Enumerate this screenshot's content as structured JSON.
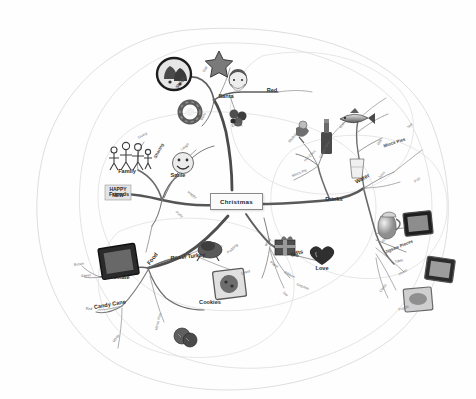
{
  "document": {
    "type": "mind-map",
    "title": "Christmas",
    "background_color": "#ffffff",
    "ink_color": "#3a3a3a",
    "style": "hand-drawn greyscale mind map with clip-art images and organic enclosing boundary outlines"
  },
  "central_node": {
    "label": "Christmas",
    "x": 238,
    "y": 202
  },
  "branches": [
    {
      "name": "people",
      "direction": "left",
      "color": "#555555",
      "nodes": [
        {
          "label": "Family",
          "level": 1,
          "x": 127,
          "y": 171,
          "rotate": 0
        },
        {
          "label": "Friends",
          "level": 1,
          "x": 119,
          "y": 194,
          "rotate": 0
        },
        {
          "label": "Smile",
          "level": 1,
          "x": 178,
          "y": 175,
          "rotate": 0
        },
        {
          "label": "Sharing",
          "level": 2,
          "x": 163,
          "y": 158,
          "rotate": -62
        },
        {
          "label": "Giving",
          "level": 3,
          "x": 143,
          "y": 138,
          "rotate": -28
        },
        {
          "label": "Laugh",
          "level": 3,
          "x": 186,
          "y": 150,
          "rotate": -40
        },
        {
          "label": "Happy",
          "level": 3,
          "x": 193,
          "y": 192,
          "rotate": 34
        },
        {
          "label": "Party",
          "level": 3,
          "x": 180,
          "y": 212,
          "rotate": 36
        }
      ]
    },
    {
      "name": "santa",
      "direction": "top",
      "color": "#4b4b4b",
      "nodes": [
        {
          "label": "Santa",
          "level": 1,
          "x": 226,
          "y": 96,
          "rotate": 0
        },
        {
          "label": "Red",
          "level": 1,
          "x": 272,
          "y": 90,
          "rotate": 0
        },
        {
          "label": "Sleigh",
          "level": 2,
          "x": 183,
          "y": 88,
          "rotate": -56
        },
        {
          "label": "Star",
          "level": 3,
          "x": 207,
          "y": 72,
          "rotate": -62
        },
        {
          "label": "Bells",
          "level": 3,
          "x": 205,
          "y": 120,
          "rotate": -60
        },
        {
          "label": "Elves",
          "level": 3,
          "x": 236,
          "y": 126,
          "rotate": -20
        }
      ]
    },
    {
      "name": "drinks",
      "direction": "upper-right",
      "color": "#5a5a5a",
      "nodes": [
        {
          "label": "Drinks",
          "level": 1,
          "x": 334,
          "y": 199,
          "rotate": 0
        },
        {
          "label": "Water",
          "level": 1,
          "x": 363,
          "y": 182,
          "rotate": -28
        },
        {
          "label": "Mince Pies",
          "level": 2,
          "x": 395,
          "y": 146,
          "rotate": -18
        },
        {
          "label": "Fish",
          "level": 3,
          "x": 344,
          "y": 128,
          "rotate": -58
        },
        {
          "label": "Mulled Wine",
          "level": 3,
          "x": 299,
          "y": 142,
          "rotate": -48
        },
        {
          "label": "Hot Choc",
          "level": 3,
          "x": 312,
          "y": 161,
          "rotate": -44
        },
        {
          "label": "Mince Pie",
          "level": 3,
          "x": 300,
          "y": 176,
          "rotate": -22
        },
        {
          "label": "Ginger Beer",
          "level": 3,
          "x": 330,
          "y": 158,
          "rotate": -62
        },
        {
          "label": "Milk",
          "level": 3,
          "x": 381,
          "y": 145,
          "rotate": -56
        },
        {
          "label": "Tea",
          "level": 3,
          "x": 411,
          "y": 128,
          "rotate": -50
        },
        {
          "label": "Juice",
          "level": 3,
          "x": 383,
          "y": 178,
          "rotate": -46
        },
        {
          "label": "Fizz",
          "level": 3,
          "x": 418,
          "y": 182,
          "rotate": -40
        }
      ]
    },
    {
      "name": "photos",
      "direction": "right",
      "color": "#5a5a5a",
      "nodes": [
        {
          "label": "Jigsaw Pieces",
          "level": 2,
          "x": 400,
          "y": 252,
          "rotate": -22
        },
        {
          "label": "Gift",
          "level": 3,
          "x": 385,
          "y": 242,
          "rotate": -46
        },
        {
          "label": "Table",
          "level": 3,
          "x": 399,
          "y": 262,
          "rotate": -12
        },
        {
          "label": "Photo",
          "level": 3,
          "x": 404,
          "y": 275,
          "rotate": -34
        },
        {
          "label": "Cards",
          "level": 3,
          "x": 385,
          "y": 292,
          "rotate": -52
        },
        {
          "label": "Puzzle",
          "level": 3,
          "x": 404,
          "y": 310,
          "rotate": -20
        }
      ]
    },
    {
      "name": "gifts",
      "direction": "lower-right",
      "color": "#5a5a5a",
      "nodes": [
        {
          "label": "Gifts",
          "level": 1,
          "x": 297,
          "y": 255,
          "rotate": -18
        },
        {
          "label": "Love",
          "level": 1,
          "x": 322,
          "y": 268,
          "rotate": 0
        },
        {
          "label": "Wrap",
          "level": 3,
          "x": 270,
          "y": 246,
          "rotate": -60
        },
        {
          "label": "Ribbon",
          "level": 3,
          "x": 290,
          "y": 272,
          "rotate": 28
        },
        {
          "label": "Paper",
          "level": 3,
          "x": 275,
          "y": 262,
          "rotate": 34
        },
        {
          "label": "Surprise",
          "level": 3,
          "x": 303,
          "y": 284,
          "rotate": 22
        },
        {
          "label": "Joy",
          "level": 3,
          "x": 286,
          "y": 292,
          "rotate": 40
        }
      ]
    },
    {
      "name": "food",
      "direction": "bottom-left",
      "color": "#4f4f4f",
      "nodes": [
        {
          "label": "Food",
          "level": 1,
          "x": 155,
          "y": 264,
          "rotate": -52
        },
        {
          "label": "Chocolate",
          "level": 1,
          "x": 116,
          "y": 277,
          "rotate": 0
        },
        {
          "label": "Candy Cane",
          "level": 1,
          "x": 110,
          "y": 307,
          "rotate": -10
        },
        {
          "label": "Roast Turkey",
          "level": 1,
          "x": 188,
          "y": 258,
          "rotate": -6
        },
        {
          "label": "Cookies",
          "level": 1,
          "x": 210,
          "y": 302,
          "rotate": 0
        },
        {
          "label": "Brown",
          "level": 3,
          "x": 79,
          "y": 265,
          "rotate": -8
        },
        {
          "label": "Sweet",
          "level": 3,
          "x": 86,
          "y": 276,
          "rotate": -4
        },
        {
          "label": "Red",
          "level": 3,
          "x": 89,
          "y": 309,
          "rotate": 0
        },
        {
          "label": "White",
          "level": 3,
          "x": 118,
          "y": 342,
          "rotate": -52
        },
        {
          "label": "Mince Pies",
          "level": 3,
          "x": 165,
          "y": 330,
          "rotate": -76
        },
        {
          "label": "Pudding",
          "level": 3,
          "x": 234,
          "y": 253,
          "rotate": -40
        },
        {
          "label": "Gravy",
          "level": 3,
          "x": 246,
          "y": 274,
          "rotate": -20
        }
      ]
    }
  ],
  "images": [
    {
      "name": "bells-icon",
      "x": 158,
      "y": 58,
      "w": 32,
      "h": 32
    },
    {
      "name": "star-icon",
      "x": 205,
      "y": 50,
      "w": 28,
      "h": 26
    },
    {
      "name": "santa-icon",
      "x": 225,
      "y": 68,
      "w": 26,
      "h": 24
    },
    {
      "name": "wreath-icon",
      "x": 178,
      "y": 101,
      "w": 24,
      "h": 22
    },
    {
      "name": "elves-icon",
      "x": 227,
      "y": 106,
      "w": 24,
      "h": 20
    },
    {
      "name": "family-icon",
      "x": 108,
      "y": 142,
      "w": 44,
      "h": 28
    },
    {
      "name": "happy-new-year",
      "x": 105,
      "y": 185,
      "w": 26,
      "h": 16
    },
    {
      "name": "smiley-icon",
      "x": 171,
      "y": 152,
      "w": 24,
      "h": 22
    },
    {
      "name": "fish-icon",
      "x": 340,
      "y": 110,
      "w": 34,
      "h": 18
    },
    {
      "name": "bell-glass-icon",
      "x": 295,
      "y": 125,
      "w": 16,
      "h": 18
    },
    {
      "name": "bottle-icon",
      "x": 320,
      "y": 122,
      "w": 12,
      "h": 32
    },
    {
      "name": "glass-icon",
      "x": 350,
      "y": 158,
      "w": 14,
      "h": 20
    },
    {
      "name": "jug-icon",
      "x": 379,
      "y": 208,
      "w": 24,
      "h": 30
    },
    {
      "name": "photo-frame-1",
      "x": 404,
      "y": 212,
      "w": 26,
      "h": 22
    },
    {
      "name": "photo-frame-2",
      "x": 428,
      "y": 258,
      "w": 26,
      "h": 22
    },
    {
      "name": "photo-frame-3",
      "x": 406,
      "y": 288,
      "w": 26,
      "h": 22
    },
    {
      "name": "gift-box-icon",
      "x": 275,
      "y": 235,
      "w": 22,
      "h": 20
    },
    {
      "name": "heart-icon",
      "x": 313,
      "y": 248,
      "w": 20,
      "h": 18
    },
    {
      "name": "chocolate-box",
      "x": 100,
      "y": 245,
      "w": 36,
      "h": 32
    },
    {
      "name": "turkey-icon",
      "x": 198,
      "y": 240,
      "w": 26,
      "h": 22
    },
    {
      "name": "cookies-photo",
      "x": 215,
      "y": 270,
      "w": 30,
      "h": 28
    },
    {
      "name": "mince-pies-icon",
      "x": 175,
      "y": 328,
      "w": 22,
      "h": 20
    }
  ],
  "boundaries": {
    "count": 4,
    "stroke": "#cfcfcf",
    "note": "faint organic closed outlines enclosing branch groups"
  }
}
